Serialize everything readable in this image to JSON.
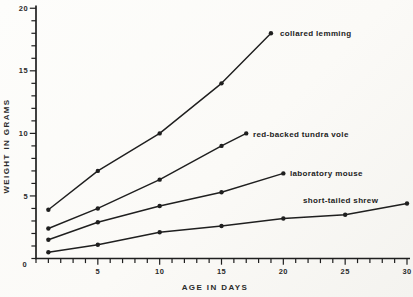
{
  "figure": {
    "background": "#fbfaf7",
    "ink_color": "#1f1f1f",
    "text_color": "#2b2b2b"
  },
  "chart_data": {
    "type": "line",
    "title": "",
    "xlabel": "AGE IN DAYS",
    "ylabel": "WEIGHT IN GRAMS",
    "xlim": [
      0,
      30
    ],
    "ylim": [
      0,
      20
    ],
    "x_major_ticks": [
      5,
      10,
      15,
      20,
      25,
      30
    ],
    "x_minor_step": 1,
    "y_major_ticks": [
      5,
      10,
      15,
      20
    ],
    "y_minor_step": 1,
    "origin_label": "0",
    "grid": false,
    "legend": "inline-labels-at-line-ends",
    "marker": "filled-dot",
    "series": [
      {
        "name": "collared lemming",
        "x": [
          1,
          5,
          10,
          15,
          19
        ],
        "y": [
          3.9,
          7.0,
          10.0,
          14.0,
          18.0
        ],
        "label_px": [
          280,
          33
        ]
      },
      {
        "name": "red-backed tundra vole",
        "x": [
          1,
          5,
          10,
          15,
          17
        ],
        "y": [
          2.4,
          4.0,
          6.3,
          9.0,
          10.0
        ],
        "label_px": [
          253,
          134
        ]
      },
      {
        "name": "laboratory mouse",
        "x": [
          1,
          5,
          10,
          15,
          20
        ],
        "y": [
          1.5,
          2.9,
          4.2,
          5.3,
          6.8
        ],
        "label_px": [
          290,
          173
        ]
      },
      {
        "name": "short-tailed shrew",
        "x": [
          1,
          5,
          10,
          15,
          20,
          25,
          30
        ],
        "y": [
          0.5,
          1.1,
          2.1,
          2.6,
          3.2,
          3.5,
          4.4
        ],
        "label_px": [
          303,
          200
        ]
      }
    ]
  }
}
